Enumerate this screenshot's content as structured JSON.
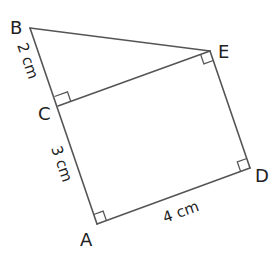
{
  "diagram": {
    "type": "geometry-figure",
    "colors": {
      "line": "#555555",
      "text": "#222222",
      "background": "#ffffff"
    },
    "vertices": [
      {
        "id": "B",
        "label": "B",
        "x": 30,
        "y": 28
      },
      {
        "id": "C",
        "label": "C",
        "x": 58,
        "y": 106
      },
      {
        "id": "A",
        "label": "A",
        "x": 97,
        "y": 224
      },
      {
        "id": "D",
        "label": "D",
        "x": 250,
        "y": 168
      },
      {
        "id": "E",
        "label": "E",
        "x": 210,
        "y": 51
      }
    ],
    "segments": [
      {
        "from": "B",
        "to": "C"
      },
      {
        "from": "C",
        "to": "A"
      },
      {
        "from": "A",
        "to": "D"
      },
      {
        "from": "D",
        "to": "E"
      },
      {
        "from": "E",
        "to": "B"
      },
      {
        "from": "C",
        "to": "E"
      }
    ],
    "right_angles": [
      "C",
      "A",
      "D",
      "E"
    ],
    "measurements": {
      "BC": "2 cm",
      "CA": "3 cm",
      "AD": "4 cm"
    },
    "labels": {
      "B": "B",
      "C": "C",
      "A": "A",
      "D": "D",
      "E": "E"
    }
  }
}
